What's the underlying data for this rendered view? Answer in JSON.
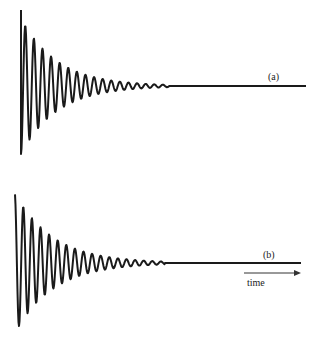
{
  "figure": {
    "panels": [
      {
        "id": "a",
        "label": "(a)",
        "description": "damped oscillation decaying to baseline",
        "baseline_y": 86,
        "x_start": 21,
        "x_end": 306,
        "amplitude_initial": 68,
        "period_px": 8.6,
        "decay_px": 36,
        "cutoff_x": 170
      },
      {
        "id": "b",
        "label": "(b)",
        "description": "damped oscillation decaying to baseline",
        "baseline_y": 263,
        "x_start": 15,
        "x_end": 301,
        "amplitude_initial": 70,
        "period_px": 8.6,
        "decay_px": 38,
        "cutoff_x": 165
      }
    ],
    "time_axis": {
      "label": "time",
      "arrow": "right-arrow"
    },
    "stroke_color": "#1a1a1a"
  }
}
